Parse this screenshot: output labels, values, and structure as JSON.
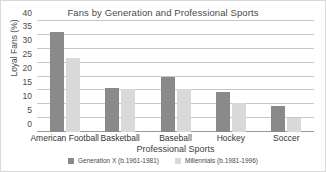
{
  "chart_data": {
    "type": "bar",
    "title": "Fans by Generation and Professional Sports",
    "xlabel": "Professional Sports",
    "ylabel": "Loyal Fans (%)",
    "ylim": [
      0,
      40
    ],
    "yticks": [
      0,
      5,
      10,
      15,
      20,
      25,
      30,
      35,
      40
    ],
    "ytick_labels": [
      "0",
      "5",
      "10",
      "15",
      "20",
      "25",
      "30",
      "35",
      "40"
    ],
    "grid": true,
    "legend_position": "bottom",
    "categories": [
      "American Football",
      "Basketball",
      "Baseball",
      "Hockey",
      "Soccer"
    ],
    "series": [
      {
        "name": "Generation X (b.1961-1981)",
        "color": "#8a8a8a",
        "values": [
          36,
          15.7,
          20,
          14.3,
          9.5
        ]
      },
      {
        "name": "Millennials (b.1981-1996)",
        "color": "#d9d9d9",
        "values": [
          26.5,
          15.5,
          15.5,
          10.4,
          5
        ]
      }
    ]
  }
}
